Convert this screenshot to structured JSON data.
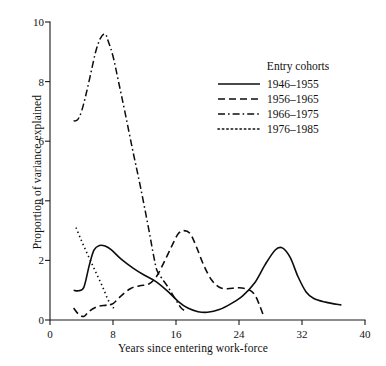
{
  "chart_data": {
    "type": "line",
    "title": "",
    "xlabel": "Years since entering work-force",
    "ylabel": "Proportion of variance explained",
    "xlim": [
      0,
      40
    ],
    "ylim": [
      0,
      10
    ],
    "xticks": [
      0,
      8,
      16,
      24,
      32,
      40
    ],
    "yticks": [
      0,
      2,
      4,
      6,
      8,
      10
    ],
    "grid": false,
    "legend_position": "upper-right",
    "legend_title": "Entry cohorts",
    "series": [
      {
        "name": "1946-1955",
        "style": "solid",
        "x": [
          3.0,
          3.6,
          4.3,
          5.0,
          5.6,
          6.3,
          7.0,
          7.8,
          9.0,
          10.5,
          12.0,
          13.5,
          15.0,
          16.3,
          17.5,
          18.8,
          20.0,
          21.5,
          23.0,
          24.5,
          26.0,
          27.3,
          28.6,
          29.5,
          30.5,
          31.5,
          32.5,
          33.5,
          35.0,
          37.0
        ],
        "y": [
          1.0,
          0.98,
          1.1,
          1.85,
          2.35,
          2.5,
          2.48,
          2.35,
          2.05,
          1.75,
          1.5,
          1.28,
          0.95,
          0.62,
          0.4,
          0.28,
          0.26,
          0.35,
          0.55,
          0.82,
          1.25,
          1.85,
          2.35,
          2.42,
          2.1,
          1.45,
          0.95,
          0.72,
          0.6,
          0.5
        ]
      },
      {
        "name": "1956-1965",
        "style": "dashed",
        "x": [
          3.0,
          3.6,
          4.3,
          5.0,
          6.0,
          7.2,
          8.0,
          9.0,
          10.2,
          11.4,
          12.5,
          13.5,
          14.5,
          15.5,
          16.3,
          17.0,
          17.8,
          18.6,
          19.5,
          20.5,
          21.5,
          22.5,
          24.0,
          25.2,
          26.0,
          26.6,
          27.1
        ],
        "y": [
          0.4,
          0.2,
          0.12,
          0.3,
          0.45,
          0.5,
          0.55,
          0.8,
          1.05,
          1.15,
          1.2,
          1.45,
          1.95,
          2.5,
          2.9,
          3.0,
          2.9,
          2.45,
          1.85,
          1.35,
          1.1,
          1.05,
          1.08,
          1.02,
          0.85,
          0.5,
          0.15
        ]
      },
      {
        "name": "1966-1975",
        "style": "dashdot",
        "x": [
          3.0,
          3.5,
          4.0,
          4.6,
          5.2,
          5.8,
          6.4,
          7.0,
          7.4,
          8.0,
          8.7,
          9.5,
          10.5,
          11.5,
          12.5,
          13.2,
          13.6,
          14.2,
          15.0,
          15.8,
          16.6,
          17.2
        ],
        "y": [
          6.68,
          6.72,
          7.0,
          7.6,
          8.3,
          9.0,
          9.45,
          9.6,
          9.35,
          8.85,
          8.0,
          7.0,
          5.7,
          4.45,
          3.1,
          2.1,
          1.65,
          1.4,
          1.1,
          0.75,
          0.42,
          0.3
        ]
      },
      {
        "name": "1976-1985",
        "style": "dotted",
        "x": [
          3.3,
          3.9,
          4.6,
          5.3,
          6.0,
          6.7,
          7.3,
          7.8,
          8.1
        ],
        "y": [
          3.1,
          2.72,
          2.3,
          1.9,
          1.5,
          1.1,
          0.72,
          0.48,
          0.4
        ]
      }
    ]
  },
  "axis": {
    "y_tick_labels": [
      "0",
      "2",
      "4",
      "6",
      "8",
      "10"
    ],
    "x_tick_labels": [
      "0",
      "8",
      "16",
      "24",
      "32",
      "40"
    ]
  },
  "legend": {
    "title": "Entry cohorts",
    "items": [
      {
        "label": "1946–1955",
        "style": "solid"
      },
      {
        "label": "1956–1965",
        "style": "dashed"
      },
      {
        "label": "1966–1975",
        "style": "dashdot"
      },
      {
        "label": "1976–1985",
        "style": "dotted"
      }
    ]
  },
  "caption": "",
  "colors": {
    "ink": "#0d0d0d",
    "background": "#ffffff"
  }
}
